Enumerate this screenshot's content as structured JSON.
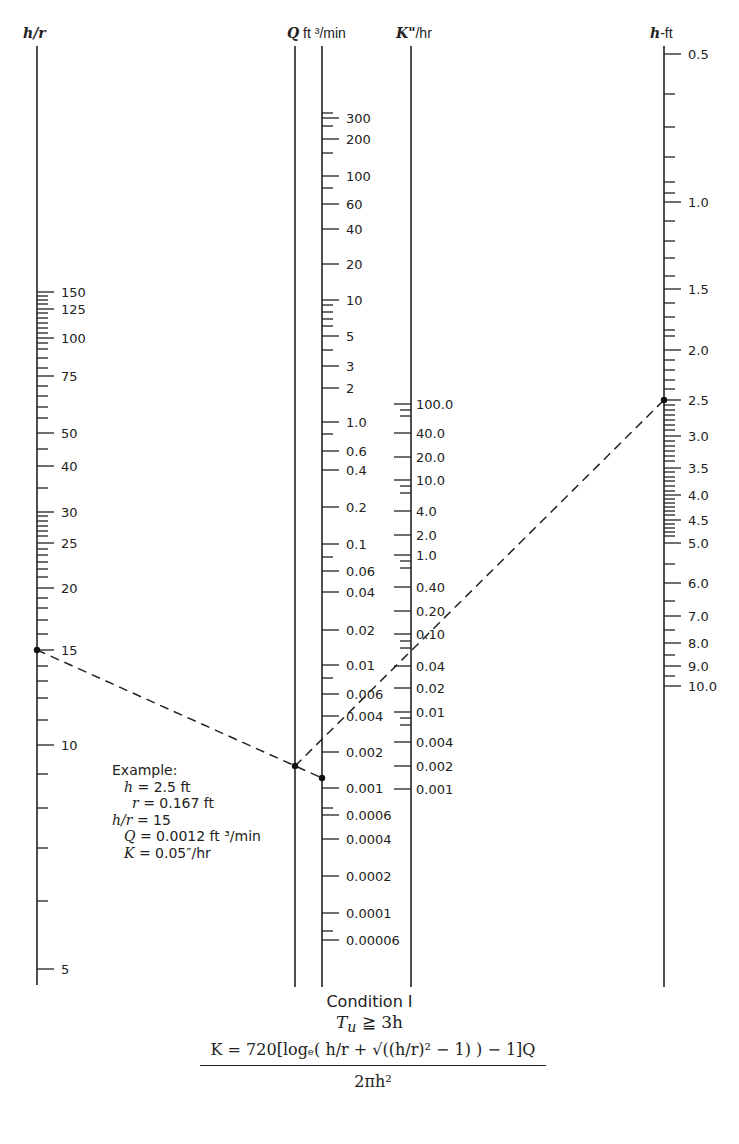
{
  "axes": {
    "hr": {
      "title_var": "h/r",
      "title_unit": "",
      "x": 37,
      "y_top": 46,
      "y_bottom": 985,
      "ticks": [
        {
          "y": 292,
          "label": "150",
          "major": true
        },
        {
          "y": 296
        },
        {
          "y": 300
        },
        {
          "y": 304
        },
        {
          "y": 309,
          "label": "125",
          "major": true
        },
        {
          "y": 313
        },
        {
          "y": 318
        },
        {
          "y": 323
        },
        {
          "y": 328
        },
        {
          "y": 333
        },
        {
          "y": 338,
          "label": "100",
          "major": true
        },
        {
          "y": 343
        },
        {
          "y": 349
        },
        {
          "y": 358
        },
        {
          "y": 368
        },
        {
          "y": 376,
          "label": "75",
          "major": true
        },
        {
          "y": 386
        },
        {
          "y": 396
        },
        {
          "y": 407
        },
        {
          "y": 418
        },
        {
          "y": 433,
          "label": "50",
          "major": true
        },
        {
          "y": 449
        },
        {
          "y": 466,
          "label": "40",
          "major": true
        },
        {
          "y": 488
        },
        {
          "y": 512,
          "label": "30",
          "major": true
        },
        {
          "y": 516
        },
        {
          "y": 521
        },
        {
          "y": 526
        },
        {
          "y": 531
        },
        {
          "y": 536
        },
        {
          "y": 543,
          "label": "25",
          "major": true
        },
        {
          "y": 549
        },
        {
          "y": 555
        },
        {
          "y": 562
        },
        {
          "y": 569
        },
        {
          "y": 577
        },
        {
          "y": 588,
          "label": "20",
          "major": true
        },
        {
          "y": 598
        },
        {
          "y": 608
        },
        {
          "y": 620
        },
        {
          "y": 634
        },
        {
          "y": 650,
          "label": "15",
          "major": true
        },
        {
          "y": 666
        },
        {
          "y": 681
        },
        {
          "y": 698
        },
        {
          "y": 720
        },
        {
          "y": 745,
          "label": "10",
          "major": true
        },
        {
          "y": 774
        },
        {
          "y": 808
        },
        {
          "y": 848
        },
        {
          "y": 901
        },
        {
          "y": 969,
          "label": "5",
          "major": true
        }
      ]
    },
    "q_left": {
      "x": 295,
      "y_top": 46,
      "y_bottom": 987
    },
    "q": {
      "title_var": "Q",
      "title_unit": " ft ³/min",
      "x": 322,
      "y_top": 46,
      "y_bottom": 987,
      "ticks": [
        {
          "y": 113
        },
        {
          "y": 118,
          "label": "300",
          "major": true
        },
        {
          "y": 126
        },
        {
          "y": 139,
          "label": "200",
          "major": true
        },
        {
          "y": 153
        },
        {
          "y": 176,
          "label": "100",
          "major": true
        },
        {
          "y": 188
        },
        {
          "y": 204,
          "label": "60",
          "major": true
        },
        {
          "y": 229,
          "label": "40",
          "major": true
        },
        {
          "y": 264,
          "label": "20",
          "major": true
        },
        {
          "y": 300,
          "label": "10",
          "major": true
        },
        {
          "y": 305
        },
        {
          "y": 312
        },
        {
          "y": 319
        },
        {
          "y": 326
        },
        {
          "y": 336,
          "label": "5",
          "major": true
        },
        {
          "y": 350
        },
        {
          "y": 366,
          "label": "3",
          "major": true
        },
        {
          "y": 388,
          "label": "2",
          "major": true
        },
        {
          "y": 422,
          "label": "1.0",
          "major": true
        },
        {
          "y": 434
        },
        {
          "y": 451,
          "label": "0.6",
          "major": true
        },
        {
          "y": 470,
          "label": "0.4",
          "major": true
        },
        {
          "y": 507,
          "label": "0.2",
          "major": true
        },
        {
          "y": 544,
          "label": "0.1",
          "major": true
        },
        {
          "y": 557
        },
        {
          "y": 571,
          "label": "0.06",
          "major": true
        },
        {
          "y": 592,
          "label": "0.04",
          "major": true
        },
        {
          "y": 630,
          "label": "0.02",
          "major": true
        },
        {
          "y": 665,
          "label": "0.01",
          "major": true
        },
        {
          "y": 678
        },
        {
          "y": 694,
          "label": "0.006",
          "major": true
        },
        {
          "y": 716,
          "label": "0.004",
          "major": true
        },
        {
          "y": 752,
          "label": "0.002",
          "major": true
        },
        {
          "y": 788,
          "label": "0.001",
          "major": true
        },
        {
          "y": 808
        },
        {
          "y": 815,
          "label": "0.0006",
          "major": true
        },
        {
          "y": 839,
          "label": "0.0004",
          "major": true
        },
        {
          "y": 876,
          "label": "0.0002",
          "major": true
        },
        {
          "y": 913,
          "label": "0.0001",
          "major": true
        },
        {
          "y": 931
        },
        {
          "y": 940,
          "label": "0.00006",
          "major": true
        }
      ]
    },
    "k": {
      "title_var": "K\"",
      "title_unit": "/hr",
      "x": 411,
      "y_top": 46,
      "y_bottom": 987,
      "ticks": [
        {
          "y": 404,
          "label": "100.0",
          "major": true
        },
        {
          "y": 410
        },
        {
          "y": 416
        },
        {
          "y": 433,
          "label": "40.0",
          "major": true
        },
        {
          "y": 457,
          "label": "20.0",
          "major": true
        },
        {
          "y": 480,
          "label": "10.0",
          "major": true
        },
        {
          "y": 486
        },
        {
          "y": 493
        },
        {
          "y": 511,
          "label": "4.0",
          "major": true
        },
        {
          "y": 535,
          "label": "2.0",
          "major": true
        },
        {
          "y": 555,
          "label": "1.0",
          "major": true
        },
        {
          "y": 561
        },
        {
          "y": 568
        },
        {
          "y": 587,
          "label": "0.40",
          "major": true
        },
        {
          "y": 611,
          "label": "0.20",
          "major": true
        },
        {
          "y": 634,
          "label": "0.10",
          "major": true
        },
        {
          "y": 641
        },
        {
          "y": 648
        },
        {
          "y": 666,
          "label": "0.04",
          "major": true
        },
        {
          "y": 688,
          "label": "0.02",
          "major": true
        },
        {
          "y": 712,
          "label": "0.01",
          "major": true
        },
        {
          "y": 718
        },
        {
          "y": 725
        },
        {
          "y": 742,
          "label": "0.004",
          "major": true
        },
        {
          "y": 766,
          "label": "0.002",
          "major": true
        },
        {
          "y": 789,
          "label": "0.001",
          "major": true
        }
      ]
    },
    "hft": {
      "title_var": "h",
      "title_unit": "-ft",
      "x": 664,
      "y_top": 46,
      "y_bottom": 987,
      "ticks": [
        {
          "y": 54,
          "label": "0.5",
          "major": true
        },
        {
          "y": 94
        },
        {
          "y": 127
        },
        {
          "y": 157
        },
        {
          "y": 182
        },
        {
          "y": 193
        },
        {
          "y": 202,
          "label": "1.0",
          "major": true
        },
        {
          "y": 221
        },
        {
          "y": 241
        },
        {
          "y": 258
        },
        {
          "y": 276
        },
        {
          "y": 289,
          "label": "1.5",
          "major": true
        },
        {
          "y": 303
        },
        {
          "y": 317
        },
        {
          "y": 330
        },
        {
          "y": 336
        },
        {
          "y": 350,
          "label": "2.0",
          "major": true
        },
        {
          "y": 360
        },
        {
          "y": 370
        },
        {
          "y": 380
        },
        {
          "y": 389
        },
        {
          "y": 400,
          "label": "2.5",
          "major": true
        },
        {
          "y": 405
        },
        {
          "y": 410
        },
        {
          "y": 415
        },
        {
          "y": 420
        },
        {
          "y": 425
        },
        {
          "y": 430
        },
        {
          "y": 436,
          "label": "3.0",
          "major": true
        },
        {
          "y": 441
        },
        {
          "y": 446
        },
        {
          "y": 451
        },
        {
          "y": 456
        },
        {
          "y": 461
        },
        {
          "y": 468,
          "label": "3.5",
          "major": true
        },
        {
          "y": 472
        },
        {
          "y": 477
        },
        {
          "y": 481
        },
        {
          "y": 486
        },
        {
          "y": 491
        },
        {
          "y": 495,
          "label": "4.0",
          "major": true
        },
        {
          "y": 499
        },
        {
          "y": 503
        },
        {
          "y": 507
        },
        {
          "y": 511
        },
        {
          "y": 515
        },
        {
          "y": 520,
          "label": "4.5",
          "major": true
        },
        {
          "y": 524
        },
        {
          "y": 528
        },
        {
          "y": 532
        },
        {
          "y": 536
        },
        {
          "y": 543,
          "label": "5.0",
          "major": true
        },
        {
          "y": 564
        },
        {
          "y": 583,
          "label": "6.0",
          "major": true
        },
        {
          "y": 601
        },
        {
          "y": 616,
          "label": "7.0",
          "major": true
        },
        {
          "y": 630
        },
        {
          "y": 643,
          "label": "8.0",
          "major": true
        },
        {
          "y": 655
        },
        {
          "y": 666,
          "label": "9.0",
          "major": true
        },
        {
          "y": 676
        },
        {
          "y": 686,
          "label": "10.0",
          "major": true
        }
      ]
    }
  },
  "example_path": {
    "line1": {
      "x1": 37,
      "y1": 650,
      "x2": 322,
      "y2": 778
    },
    "line2": {
      "x1": 295,
      "y1": 766,
      "x2": 664,
      "y2": 400
    },
    "points": [
      {
        "x": 37,
        "y": 650
      },
      {
        "x": 295,
        "y": 766
      },
      {
        "x": 322,
        "y": 778
      },
      {
        "x": 664,
        "y": 400
      }
    ]
  },
  "example": {
    "heading": "Example:",
    "rows": [
      {
        "var": "h",
        "rest": " = 2.5 ft",
        "indent": 12
      },
      {
        "var": "r",
        "rest": " = 0.167 ft",
        "indent": 20
      },
      {
        "var": "h/r",
        "rest": " = 15",
        "indent": 0
      },
      {
        "var": "Q",
        "rest": " = 0.0012 ft ³/min",
        "indent": 12
      },
      {
        "var": "K",
        "rest": " = 0.05″/hr",
        "indent": 12
      }
    ]
  },
  "caption": {
    "condition": "Condition I",
    "inequality_var": "T",
    "inequality_sub": "u",
    "inequality_rest": " ≧ 3h"
  },
  "formula": {
    "numerator": "K = 720[logₑ( h/r + √((h/r)² − 1) ) − 1]Q",
    "denominator": "2πh²"
  }
}
